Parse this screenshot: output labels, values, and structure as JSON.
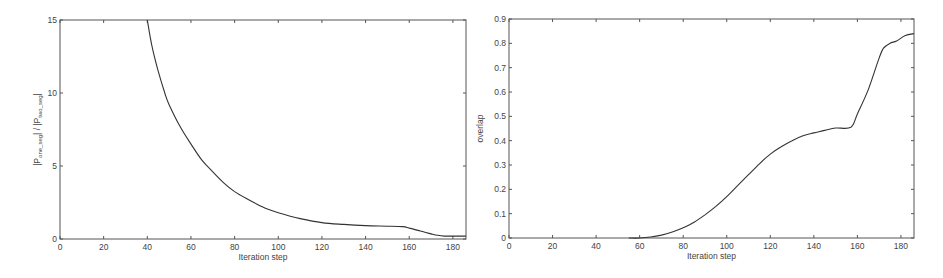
{
  "chart_data": [
    {
      "type": "line",
      "id": "ratio",
      "title": "",
      "xlabel": "Iteration step",
      "ylabel": "|P_one_seg| / |P_two_seg|",
      "ylabel_parts": [
        "|P",
        "one_seg",
        "| / |P",
        "two_seg",
        "|"
      ],
      "xlim": [
        0,
        186
      ],
      "ylim": [
        0,
        15
      ],
      "xticks": [
        0,
        20,
        40,
        60,
        80,
        100,
        120,
        140,
        160,
        180
      ],
      "yticks": [
        0,
        5,
        10,
        15
      ],
      "grid": false,
      "legend": null,
      "frame_px": {
        "x0": 60,
        "y0": 20,
        "x1": 466,
        "y1": 239
      },
      "series": [
        {
          "name": "ratio",
          "x": [
            40,
            42,
            45,
            48,
            50,
            55,
            60,
            65,
            70,
            75,
            80,
            85,
            90,
            95,
            100,
            110,
            120,
            130,
            140,
            150,
            157,
            160,
            165,
            170,
            173,
            176,
            180,
            186
          ],
          "y": [
            15,
            13.3,
            11.5,
            10.0,
            9.2,
            7.7,
            6.5,
            5.4,
            4.6,
            3.85,
            3.25,
            2.8,
            2.4,
            2.05,
            1.8,
            1.4,
            1.12,
            1.0,
            0.92,
            0.88,
            0.85,
            0.75,
            0.55,
            0.35,
            0.25,
            0.2,
            0.2,
            0.2
          ]
        }
      ]
    },
    {
      "type": "line",
      "id": "overlap",
      "title": "",
      "xlabel": "Iteration step",
      "ylabel": "overlap",
      "xlim": [
        0,
        186
      ],
      "ylim": [
        0,
        0.9
      ],
      "xticks": [
        0,
        20,
        40,
        60,
        80,
        100,
        120,
        140,
        160,
        180
      ],
      "yticks": [
        0,
        0.1,
        0.2,
        0.3,
        0.4,
        0.5,
        0.6,
        0.7,
        0.8,
        0.9
      ],
      "grid": false,
      "legend": null,
      "frame_px": {
        "x0": 509,
        "y0": 19,
        "x1": 914,
        "y1": 238
      },
      "series": [
        {
          "name": "overlap",
          "x": [
            55,
            60,
            65,
            70,
            75,
            80,
            85,
            90,
            95,
            100,
            105,
            110,
            115,
            120,
            125,
            130,
            135,
            140,
            145,
            150,
            157,
            160,
            165,
            170,
            172,
            175,
            178,
            182,
            186
          ],
          "y": [
            0,
            0.0,
            0.004,
            0.012,
            0.025,
            0.042,
            0.065,
            0.095,
            0.13,
            0.17,
            0.215,
            0.26,
            0.305,
            0.345,
            0.375,
            0.4,
            0.42,
            0.432,
            0.442,
            0.452,
            0.455,
            0.51,
            0.61,
            0.74,
            0.78,
            0.8,
            0.81,
            0.832,
            0.84
          ]
        }
      ]
    }
  ]
}
